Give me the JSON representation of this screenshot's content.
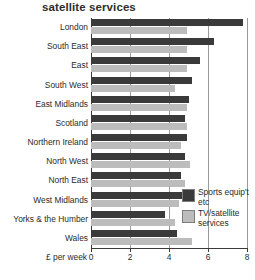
{
  "chart_data": {
    "type": "bar",
    "orientation": "horizontal",
    "title": "satellite services",
    "xlabel": "£ per week",
    "ylabel": "",
    "xlim": [
      0,
      8
    ],
    "xticks": [
      0,
      2,
      4,
      6,
      8
    ],
    "xtick_labels": [
      "0",
      "2",
      "4",
      "6",
      "8"
    ],
    "grid": true,
    "grid_axis": "x",
    "legend_position": "inside-right",
    "categories": [
      "London",
      "South East",
      "East",
      "South West",
      "East Midlands",
      "Scotland",
      "Northern Ireland",
      "North West",
      "North East",
      "West Midlands",
      "Yorks & the Humber",
      "Wales"
    ],
    "series": [
      {
        "name": "Sports equip't etc",
        "color": "#3a3a3a",
        "values": [
          7.8,
          6.3,
          5.6,
          5.2,
          5.0,
          4.8,
          4.9,
          4.8,
          4.6,
          4.7,
          3.8,
          4.4
        ]
      },
      {
        "name": "TV/satellite services",
        "color": "#bcbcbc",
        "values": [
          4.9,
          4.9,
          4.9,
          4.3,
          4.9,
          4.9,
          4.6,
          5.1,
          4.8,
          4.5,
          4.3,
          5.2
        ]
      }
    ]
  },
  "legend": {
    "items": [
      {
        "label": "Sports equip't etc",
        "color": "#3a3a3a"
      },
      {
        "label": "TV/satellite services",
        "color": "#bcbcbc"
      }
    ]
  }
}
